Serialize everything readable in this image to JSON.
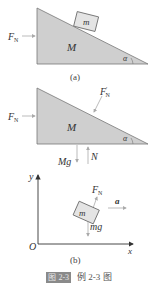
{
  "figure": {
    "panel_a": {
      "caption": "(a)",
      "labels": {
        "force_left": "F",
        "force_left_sub": "N",
        "big_mass": "M",
        "small_mass": "m",
        "angle": "α"
      }
    },
    "panel_b_top": {
      "labels": {
        "force_left": "F",
        "force_left_sub": "N",
        "reaction": "F",
        "reaction_sub": "N",
        "reaction_prime": "′",
        "big_mass": "M",
        "angle": "α",
        "weight": "Mg",
        "normal": "N"
      }
    },
    "panel_b_bottom": {
      "caption": "(b)",
      "labels": {
        "y_axis": "y",
        "x_axis": "x",
        "origin": "O",
        "normal": "F",
        "normal_sub": "N",
        "mass": "m",
        "weight": "mg",
        "accel": "a"
      }
    },
    "caption": {
      "badge": "图 2-3",
      "text": "例 2-3 图"
    }
  },
  "colors": {
    "wedge_fill": "#cfcfcf",
    "wedge_stroke": "#777777",
    "arrow": "#aaaaaa",
    "text": "#333333",
    "badge_bg": "#8a8a8a"
  }
}
